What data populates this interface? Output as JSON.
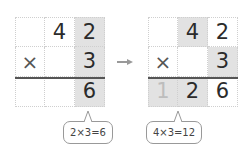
{
  "arrow": {
    "icon": "arrow-right-icon",
    "color": "#999999"
  },
  "left": {
    "rows": [
      [
        "",
        "4",
        "2"
      ],
      [
        "×",
        "",
        "3"
      ],
      [
        "",
        "",
        "6"
      ]
    ],
    "shaded": [
      [
        0,
        2
      ],
      [
        1,
        2
      ],
      [
        2,
        2
      ]
    ],
    "bubble": "2×3=6"
  },
  "right": {
    "rows": [
      [
        "",
        "4",
        "2"
      ],
      [
        "×",
        "",
        "3"
      ],
      [
        "1",
        "2",
        "6"
      ]
    ],
    "shaded": [
      [
        0,
        1
      ],
      [
        1,
        2
      ],
      [
        2,
        0
      ],
      [
        2,
        1
      ]
    ],
    "bubble": "4×3=12"
  },
  "colors": {
    "shade": "#e2e2e2",
    "grid": "#cfcfcf",
    "text": "#2b2b2b"
  }
}
